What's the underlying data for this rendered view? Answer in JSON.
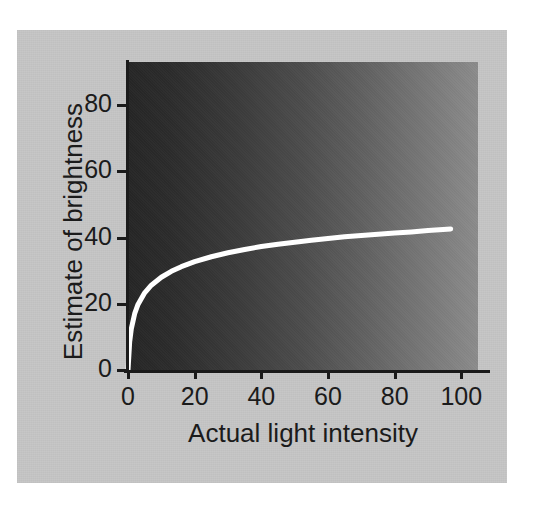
{
  "figure": {
    "background_color": "#c6c6c6",
    "page_color": "#ffffff",
    "curve_color": "#ffffff",
    "axis_color": "#1b1b1b",
    "gradient_dark": "#262626",
    "gradient_light": "#8c8c8c"
  },
  "chart_data": {
    "type": "line",
    "title": "",
    "subtitle": "",
    "xlabel": "Actual light intensity",
    "ylabel": "Estimate of brightness",
    "xlim": [
      0,
      105
    ],
    "ylim": [
      0,
      93
    ],
    "xticks": [
      0,
      20,
      40,
      60,
      80,
      100
    ],
    "xtick_labels": [
      "0",
      "20",
      "40",
      "60",
      "80",
      "100"
    ],
    "yticks": [
      0,
      20,
      40,
      60,
      80
    ],
    "ytick_labels": [
      "0",
      "20",
      "40",
      "60",
      "80"
    ],
    "grid": false,
    "legend": null,
    "legend_position": "none",
    "annotations": [],
    "background_gradient": {
      "direction": "left-to-right",
      "from": "#262626",
      "to": "#8c8c8c",
      "meaning": "actual light intensity rendered as a luminance ramp"
    },
    "series": [
      {
        "name": "Estimate of brightness",
        "color": "#ffffff",
        "line_width": 5,
        "x": [
          0,
          0.5,
          1,
          2,
          3,
          5,
          7,
          10,
          13,
          16,
          20,
          25,
          30,
          35,
          40,
          45,
          50,
          55,
          60,
          65,
          70,
          75,
          80,
          85,
          90,
          96.8
        ],
        "y": [
          0,
          8.5,
          12.5,
          17.0,
          19.8,
          23.3,
          25.6,
          28.0,
          29.8,
          31.2,
          32.7,
          34.2,
          35.4,
          36.4,
          37.3,
          38.0,
          38.6,
          39.2,
          39.7,
          40.2,
          40.6,
          41.0,
          41.4,
          41.7,
          42.1,
          42.6
        ]
      }
    ]
  }
}
